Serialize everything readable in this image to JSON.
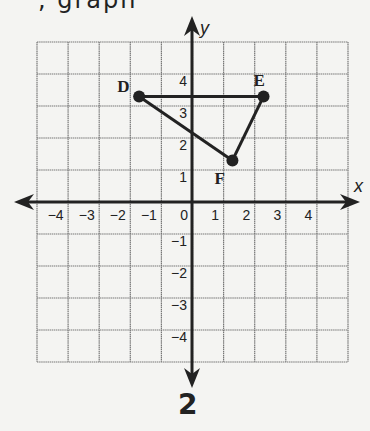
{
  "header": {
    "partial_text": ", graph"
  },
  "figure_label": "2",
  "axes": {
    "x_label": "x",
    "y_label": "y",
    "x_ticks": [
      "−4",
      "−3",
      "−2",
      "−1",
      "0",
      "1",
      "2",
      "3",
      "4"
    ],
    "y_ticks": [
      "4",
      "3",
      "2",
      "1",
      "−1",
      "−2",
      "−3",
      "−4"
    ],
    "range": {
      "xmin": -5,
      "xmax": 5,
      "ymin": -5,
      "ymax": 5
    }
  },
  "chart_data": {
    "type": "scatter",
    "title": "",
    "xlabel": "x",
    "ylabel": "y",
    "xlim": [
      -5,
      5
    ],
    "ylim": [
      -5,
      5
    ],
    "grid": true,
    "points": [
      {
        "label": "D",
        "x": -1.7,
        "y": 3.3
      },
      {
        "label": "E",
        "x": 2.3,
        "y": 3.3
      },
      {
        "label": "F",
        "x": 1.3,
        "y": 1.3
      }
    ],
    "segments": [
      [
        "D",
        "E"
      ],
      [
        "D",
        "F"
      ],
      [
        "E",
        "F"
      ]
    ]
  },
  "colors": {
    "ink": "#222222",
    "grid": "#777777",
    "paper": "#f4f4f2"
  }
}
